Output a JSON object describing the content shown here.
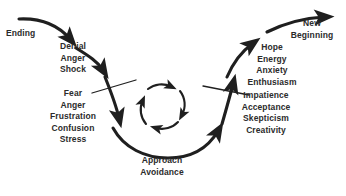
{
  "diagram": {
    "background_color": "#ffffff",
    "stroke_color": "#1f1f1f",
    "text_color": "#2b2b2b",
    "stages": {
      "ending": {
        "label": "Ending",
        "lines": [
          "Ending"
        ]
      },
      "denial": {
        "lines": [
          "Denial",
          "Anger",
          "Shock"
        ]
      },
      "fear": {
        "lines": [
          "Fear",
          "Anger",
          "Frustration",
          "Confusion",
          "Stress"
        ]
      },
      "approach": {
        "lines": [
          "Approach",
          "Avoidance"
        ]
      },
      "hope": {
        "lines": [
          "Hope",
          "Energy",
          "Anxiety",
          "Enthusiasm"
        ]
      },
      "impatience": {
        "lines": [
          "Impatience",
          "Acceptance",
          "Skepticism",
          "Creativity"
        ]
      },
      "new_beginning": {
        "lines": [
          "New",
          "Beginning"
        ]
      }
    },
    "icons": {
      "entry_arrow": "curved-arrow-down-right",
      "descent_arrow_upper": "curved-arrow-down",
      "descent_arrow_lower": "curved-arrow-down",
      "trough_arrow": "curved-arrow-right",
      "ascent_arrow_lower": "curved-arrow-up-right",
      "ascent_arrow_upper": "curved-arrow-up-right",
      "exit_arrow": "curved-arrow-up-right",
      "loop": "circular-loop-arrows",
      "barrier_left": "diagonal-barrier-line",
      "barrier_right": "diagonal-barrier-line"
    }
  }
}
